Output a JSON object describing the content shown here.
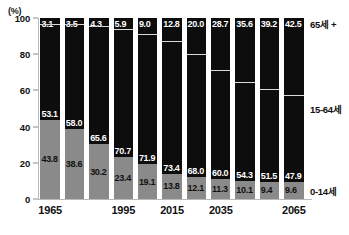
{
  "chart_data": {
    "type": "bar",
    "title": "",
    "subtitle": "",
    "xlabel": "",
    "ylabel": "(%)",
    "ylim": [
      0,
      100
    ],
    "yticks": [
      "100",
      "80",
      "60",
      "40",
      "20",
      "0"
    ],
    "grid": false,
    "stacked": true,
    "stack_mode": "percent",
    "legend_position": "right",
    "categories": [
      "1965",
      "1975",
      "1985",
      "1995",
      "2005",
      "2015",
      "2025",
      "2035",
      "2045",
      "2055",
      "2065"
    ],
    "visible_tick_labels": [
      "1965",
      "1995",
      "2015",
      "2035",
      "2065"
    ],
    "series": [
      {
        "name": "0-14세",
        "color": "#8a8a8a",
        "values": [
          43.8,
          38.6,
          30.2,
          23.4,
          19.1,
          13.8,
          12.1,
          11.3,
          10.1,
          9.4,
          9.6
        ]
      },
      {
        "name": "15-64세",
        "color": "#0d0d0d",
        "values": [
          53.1,
          58.0,
          65.6,
          70.7,
          71.9,
          73.4,
          68.0,
          60.0,
          54.3,
          51.5,
          47.9
        ]
      },
      {
        "name": "65세 +",
        "color": "#0d0d0d",
        "values": [
          3.1,
          3.5,
          4.3,
          5.9,
          9.0,
          12.8,
          20.0,
          28.7,
          35.6,
          39.2,
          42.5
        ]
      }
    ]
  },
  "axis": {
    "unit_label": "(%)",
    "y_ticks": [
      "100",
      "80",
      "60",
      "40",
      "20",
      "0"
    ],
    "x_ticks": [
      {
        "label": "1965",
        "bar_index": 0
      },
      {
        "label": "1995",
        "bar_index": 3
      },
      {
        "label": "2015",
        "bar_index": 5
      },
      {
        "label": "2035",
        "bar_index": 7
      },
      {
        "label": "2065",
        "bar_index": 10
      }
    ]
  },
  "legend": {
    "old_label": "65세 +",
    "working_label": "15-64세",
    "young_label": "0-14세"
  },
  "bars": [
    {
      "year": "1965",
      "old": "3.1",
      "work": "53.1",
      "young": "43.8"
    },
    {
      "year": "1975",
      "old": "3.5",
      "work": "58.0",
      "young": "38.6"
    },
    {
      "year": "1985",
      "old": "4.3",
      "work": "65.6",
      "young": "30.2"
    },
    {
      "year": "1995",
      "old": "5.9",
      "work": "70.7",
      "young": "23.4"
    },
    {
      "year": "2005",
      "old": "9.0",
      "work": "71.9",
      "young": "19.1"
    },
    {
      "year": "2015",
      "old": "12.8",
      "work": "73.4",
      "young": "13.8"
    },
    {
      "year": "2025",
      "old": "20.0",
      "work": "68.0",
      "young": "12.1"
    },
    {
      "year": "2035",
      "old": "28.7",
      "work": "60.0",
      "young": "11.3"
    },
    {
      "year": "2045",
      "old": "35.6",
      "work": "54.3",
      "young": "10.1"
    },
    {
      "year": "2055",
      "old": "39.2",
      "work": "51.5",
      "young": "9.4"
    },
    {
      "year": "2065",
      "old": "42.5",
      "work": "47.9",
      "young": "9.6"
    }
  ]
}
